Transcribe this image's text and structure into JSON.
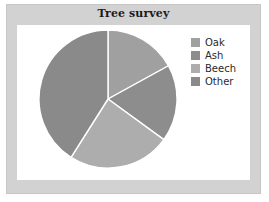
{
  "chart": {
    "title": "Tree survey",
    "frame_color": "#d2d2d2",
    "panel_color": "#ffffff",
    "title_color": "#1b1b1b"
  },
  "legend": {
    "position": "right",
    "items": [
      {
        "label": "Oak",
        "color": "#a0a0a0"
      },
      {
        "label": "Ash",
        "color": "#8d8d8d"
      },
      {
        "label": "Beech",
        "color": "#adadad"
      },
      {
        "label": "Other",
        "color": "#8a8a8a"
      }
    ]
  },
  "chart_data": {
    "type": "pie",
    "title": "Tree survey",
    "xlabel": "",
    "ylabel": "",
    "categories": [
      "Oak",
      "Ash",
      "Beech",
      "Other"
    ],
    "values": [
      17,
      18,
      24,
      41
    ],
    "units": "percent",
    "colors": [
      "#a0a0a0",
      "#8d8d8d",
      "#adadad",
      "#8a8a8a"
    ],
    "start_angle_deg": 0,
    "direction": "clockwise",
    "slice_separator_color": "#ffffff",
    "legend_position": "right",
    "grid": false
  }
}
